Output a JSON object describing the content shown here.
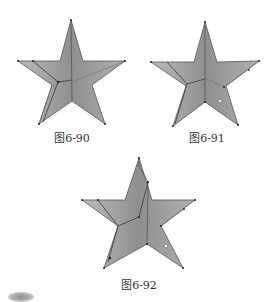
{
  "figures": [
    {
      "id": "fig-6-90",
      "caption": "图6-90",
      "fill_color": "#a9a9a9",
      "crease_color": "#6f6f6f",
      "outline_color": "#555555"
    },
    {
      "id": "fig-6-91",
      "caption": "图6-91",
      "fill_color": "#a9a9a9",
      "crease_color": "#6f6f6f",
      "outline_color": "#555555"
    },
    {
      "id": "fig-6-92",
      "caption": "图6-92",
      "fill_color": "#a9a9a9",
      "crease_color": "#6f6f6f",
      "outline_color": "#555555"
    }
  ]
}
